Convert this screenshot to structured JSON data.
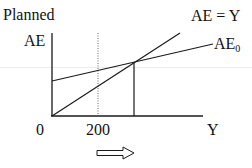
{
  "diagram": {
    "y_axis_label_top": "Planned",
    "y_axis_label": "AE",
    "x_axis_label": "Y",
    "origin_label": "0",
    "x_tick_label": "200",
    "lines": {
      "forty_five": {
        "label": "AE = Y"
      },
      "ae0": {
        "label_main": "AE",
        "label_sub": "0"
      }
    },
    "arrow": {
      "icon": "hollow-right-arrow-icon",
      "direction": "right"
    },
    "colors": {
      "line": "#1a1a1a",
      "dotted": "#555555",
      "guide": "#ececec"
    }
  }
}
